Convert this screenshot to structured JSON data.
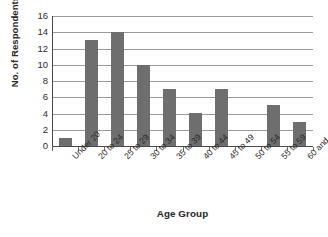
{
  "chart_data": {
    "type": "bar",
    "title": "",
    "subtitle": "",
    "xlabel": "Age Group",
    "ylabel": "No. of Respondents",
    "categories": [
      "Under 20",
      "20 to 24",
      "25 to 29",
      "30 to 34",
      "35 to 39",
      "40 to 44",
      "45 to 49",
      "50 to 54",
      "55 to 59",
      "60 and over"
    ],
    "values": [
      1,
      13,
      14,
      10,
      7,
      4,
      7,
      0,
      5,
      3
    ],
    "ylim": [
      0,
      16
    ],
    "ytick_labels": [
      "16",
      "14",
      "12",
      "10",
      "8",
      "6",
      "4",
      "2",
      "0"
    ],
    "ytick_values": [
      16,
      14,
      12,
      10,
      8,
      6,
      4,
      2,
      0
    ],
    "ytick_step": 2,
    "grid": true,
    "grid_axis": "y",
    "legend": false,
    "legend_position": "none",
    "bar_color": "#6e6e6e",
    "gridline_color": "#9a9a9a",
    "axis_color": "#4a4a4a",
    "background_color": "#ffffff",
    "annotations": []
  }
}
